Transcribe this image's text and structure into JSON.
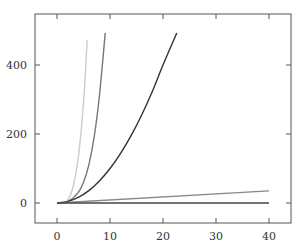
{
  "chart_data": {
    "type": "line",
    "title": "",
    "xlabel": "",
    "ylabel": "",
    "xlim": [
      -3.5,
      44
    ],
    "ylim": [
      -60,
      545
    ],
    "grid": false,
    "legend": null,
    "x_ticks": [
      0,
      10,
      20,
      30,
      40
    ],
    "y_ticks": [
      0,
      200,
      400
    ],
    "x_tick_labels": [
      "0",
      "10",
      "20",
      "30",
      "40"
    ],
    "y_tick_labels": [
      "0",
      "200",
      "400"
    ],
    "series": [
      {
        "name": "curve-steepest",
        "color": "#cccccc",
        "x": [
          0,
          1,
          2,
          3,
          4,
          5,
          5.7
        ],
        "y": [
          0,
          1,
          8,
          45,
          130,
          290,
          472
        ]
      },
      {
        "name": "curve-steep",
        "color": "#777777",
        "x": [
          0,
          2,
          4,
          5,
          6,
          7,
          8,
          9.1
        ],
        "y": [
          0,
          4,
          30,
          60,
          110,
          190,
          310,
          493
        ]
      },
      {
        "name": "curve-quadratic",
        "color": "#333333",
        "x": [
          0,
          2,
          4,
          6,
          8,
          10,
          12,
          14,
          16,
          18,
          20,
          22.6
        ],
        "y": [
          0,
          4,
          16,
          36,
          64,
          100,
          144,
          196,
          256,
          324,
          400,
          493
        ]
      },
      {
        "name": "line-linear",
        "color": "#888888",
        "x": [
          0,
          40
        ],
        "y": [
          0,
          35
        ]
      },
      {
        "name": "line-flat",
        "color": "#444444",
        "x": [
          0,
          40
        ],
        "y": [
          0,
          0
        ]
      }
    ]
  }
}
